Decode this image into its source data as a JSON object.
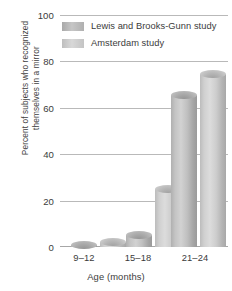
{
  "chart_data": {
    "type": "bar",
    "title": "",
    "xlabel": "Age (months)",
    "ylabel": "Percent of subjects who recognized themselves in a mirror",
    "categories": [
      "9–12",
      "15–18",
      "21–24"
    ],
    "series": [
      {
        "name": "Lewis and Brooks-Gunn study",
        "values": [
          1,
          5,
          66
        ]
      },
      {
        "name": "Amsterdam study",
        "values": [
          2,
          25,
          75
        ]
      }
    ],
    "ylim": [
      0,
      100
    ],
    "yticks": [
      0,
      20,
      40,
      60,
      80,
      100
    ],
    "ytick_labels": [
      "0",
      "20",
      "40",
      "60",
      "80",
      "100"
    ],
    "grid": true,
    "legend_position": "top-left-inside",
    "colors": {
      "series_a": "#b4b4b4",
      "series_b": "#cccccc",
      "gridline": "#b9b9b9",
      "text": "#3b3b3b",
      "background": "#ffffff"
    }
  }
}
